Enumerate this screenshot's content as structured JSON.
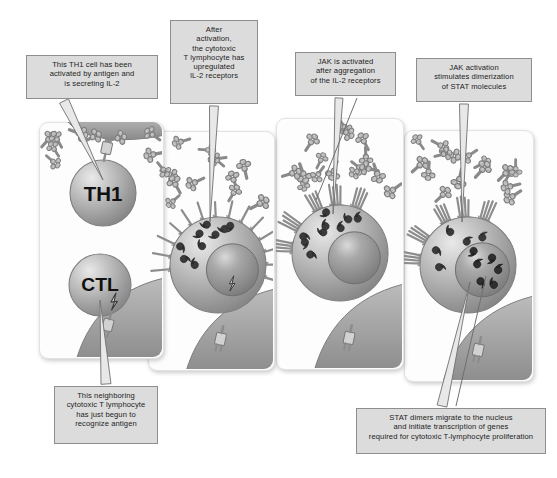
{
  "figure": {
    "background_color": "#ffffff",
    "caption_fill": "#dcdcdc",
    "caption_border": "#8e8e8e",
    "panel_fill": "#fdfdfd",
    "cell_color": "#a8a8a8",
    "nucleus_color": "#8f8f8f",
    "apc_color": "#9a9a9a"
  },
  "captions": [
    {
      "id": "caption-th1",
      "lines": [
        "This TH1 cell has been",
        "activated by antigen and",
        "is secreting IL-2"
      ],
      "box": {
        "x": 26,
        "y": 55,
        "w": 132,
        "h": 44
      },
      "font_size": 7.6
    },
    {
      "id": "caption-upregulated-receptors",
      "lines": [
        "After",
        "activation,",
        "the cytotoxic",
        "T lymphocyte has",
        "upregulated",
        "IL-2 receptors"
      ],
      "box": {
        "x": 170,
        "y": 20,
        "w": 88,
        "h": 84
      },
      "font_size": 7.6
    },
    {
      "id": "caption-jak-activated",
      "lines": [
        "JAK is activated",
        "after aggregation",
        "of the IL-2 receptors"
      ],
      "box": {
        "x": 295,
        "y": 52,
        "w": 101,
        "h": 44
      },
      "font_size": 7.6
    },
    {
      "id": "caption-jak-stat-dimerization",
      "lines": [
        "JAK activation",
        "stimulates dimerization",
        "of STAT molecules"
      ],
      "box": {
        "x": 416,
        "y": 58,
        "w": 116,
        "h": 44
      },
      "font_size": 7.6
    },
    {
      "id": "caption-neighboring-ctl",
      "lines": [
        "This neighboring",
        "cytotoxic T lymphocyte",
        "has just begun to",
        "recognize antigen"
      ],
      "box": {
        "x": 54,
        "y": 386,
        "w": 104,
        "h": 58
      },
      "font_size": 7.6
    },
    {
      "id": "caption-stat-dimers-nucleus",
      "lines": [
        "STAT dimers migrate to the nucleus",
        "and initiate transcription of genes",
        "required for cytotoxic T-lymphocyte proliferation"
      ],
      "box": {
        "x": 356,
        "y": 408,
        "w": 190,
        "h": 46
      },
      "font_size": 7.6
    }
  ],
  "panels": [
    {
      "id": "panel-1",
      "order": 1,
      "box": {
        "x": 39,
        "y": 122,
        "w": 123,
        "h": 235
      },
      "cells": [
        {
          "label": "TH1",
          "cx": 103,
          "cy": 193,
          "r": 33
        },
        {
          "label": "CTL",
          "cx": 100,
          "cy": 285,
          "r": 31
        }
      ],
      "has_apc_top": true,
      "has_apc_bottom": true,
      "il2_count": 9,
      "receptors_on_cell": false,
      "jak_count": 0,
      "nucleus": false,
      "stat_dimers_in_nucleus": 0
    },
    {
      "id": "panel-2",
      "order": 2,
      "box": {
        "x": 148,
        "y": 131,
        "w": 125,
        "h": 238
      },
      "cells": [
        {
          "label": "",
          "cx": 218,
          "cy": 265,
          "r": 48
        }
      ],
      "has_apc_top": false,
      "has_apc_bottom": true,
      "il2_count": 13,
      "receptors_on_cell": true,
      "receptor_style": "spread",
      "jak_count": 9,
      "nucleus": true,
      "nucleus_r": 26,
      "stat_dimers_in_nucleus": 0
    },
    {
      "id": "panel-3",
      "order": 3,
      "box": {
        "x": 276,
        "y": 118,
        "w": 126,
        "h": 250
      },
      "cells": [
        {
          "label": "",
          "cx": 340,
          "cy": 253,
          "r": 48
        }
      ],
      "has_apc_top": false,
      "has_apc_bottom": true,
      "il2_count": 16,
      "receptors_on_cell": true,
      "receptor_style": "aggregated",
      "jak_count": 9,
      "nucleus": true,
      "nucleus_r": 26,
      "stat_dimers_in_nucleus": 0
    },
    {
      "id": "panel-4",
      "order": 4,
      "box": {
        "x": 404,
        "y": 130,
        "w": 128,
        "h": 250
      },
      "cells": [
        {
          "label": "",
          "cx": 468,
          "cy": 265,
          "r": 48
        }
      ],
      "has_apc_top": false,
      "has_apc_bottom": true,
      "il2_count": 16,
      "receptors_on_cell": true,
      "receptor_style": "aggregated",
      "jak_count": 5,
      "nucleus": true,
      "nucleus_r": 27,
      "stat_dimers_in_nucleus": 3
    }
  ],
  "legend_terms": {
    "il2": "IL-2 molecule",
    "il2_receptor": "IL-2 receptor",
    "jak": "JAK molecule",
    "stat": "STAT molecule",
    "stat_dimer": "STAT dimer",
    "tcr_mhc": "TCR-MHC complex",
    "apc": "antigen-presenting cell"
  }
}
